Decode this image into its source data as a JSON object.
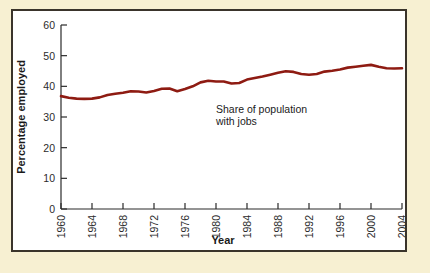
{
  "figure": {
    "background_color": "#f7f0d2",
    "frame_color": "#3a342b",
    "plot_background": "#ffffff"
  },
  "chart_data": {
    "type": "line",
    "title": "",
    "subtitle": "",
    "xlabel": "Year",
    "ylabel": "Percentage employed",
    "xlim": [
      1960,
      2004
    ],
    "ylim": [
      0,
      60
    ],
    "grid": false,
    "legend_position": "none",
    "line_color": "#8e1b12",
    "line_width": 2.6,
    "x_ticks": [
      1960,
      1964,
      1968,
      1972,
      1976,
      1980,
      1984,
      1988,
      1992,
      1996,
      2000,
      2004
    ],
    "x_tick_labels": [
      "1960",
      "1964",
      "1968",
      "1972",
      "1976",
      "1980",
      "1984",
      "1988",
      "1992",
      "1996",
      "2000",
      "2004"
    ],
    "x_tick_label_rotation": 90,
    "y_ticks": [
      0,
      10,
      20,
      30,
      40,
      50,
      60
    ],
    "y_tick_labels": [
      "0",
      "10",
      "20",
      "30",
      "40",
      "50",
      "60"
    ],
    "series": [
      {
        "name": "Share of population with jobs",
        "x": [
          1960,
          1961,
          1962,
          1963,
          1964,
          1965,
          1966,
          1967,
          1968,
          1969,
          1970,
          1971,
          1972,
          1973,
          1974,
          1975,
          1976,
          1977,
          1978,
          1979,
          1980,
          1981,
          1982,
          1983,
          1984,
          1985,
          1986,
          1987,
          1988,
          1989,
          1990,
          1991,
          1992,
          1993,
          1994,
          1995,
          1996,
          1997,
          1998,
          1999,
          2000,
          2001,
          2002,
          2003,
          2004
        ],
        "values": [
          36.8,
          36.3,
          36.0,
          35.9,
          36.0,
          36.4,
          37.2,
          37.6,
          37.9,
          38.4,
          38.3,
          38.0,
          38.5,
          39.2,
          39.3,
          38.4,
          39.1,
          40.0,
          41.3,
          41.8,
          41.6,
          41.6,
          40.9,
          41.1,
          42.2,
          42.7,
          43.2,
          43.8,
          44.4,
          44.9,
          44.7,
          44.0,
          43.8,
          44.0,
          44.8,
          45.1,
          45.5,
          46.1,
          46.4,
          46.7,
          47.0,
          46.4,
          45.9,
          45.8,
          45.9
        ]
      }
    ],
    "annotations": [
      {
        "text_line_1": "Share of population",
        "text_line_2": "with jobs",
        "x_data": 1988,
        "y_data": 33
      }
    ]
  }
}
